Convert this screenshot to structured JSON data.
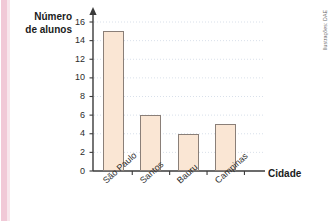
{
  "credit": "Ilustrações: DAE",
  "colors": {
    "bar_fill": "#fae6d4",
    "bar_stroke": "#8a7f78",
    "axis": "#3a3a3a",
    "grid": "#cfd8e4",
    "page_stripe": "#f1c9d7",
    "text": "#1b1b1b"
  },
  "y_axis_title_line1": "Número",
  "y_axis_title_line2": "de alunos",
  "chart_data": {
    "type": "bar",
    "title": "",
    "subtitle": "",
    "xlabel": "Cidade",
    "ylabel": "Número de alunos",
    "categories": [
      "São Paulo",
      "Santos",
      "Bauru",
      "Campinas"
    ],
    "values": [
      15,
      6,
      4,
      5
    ],
    "ylim": [
      0,
      16
    ],
    "ytick_labels": [
      "0",
      "2",
      "4",
      "6",
      "8",
      "10",
      "12",
      "14",
      "16"
    ],
    "ytick_values": [
      0,
      2,
      4,
      6,
      8,
      10,
      12,
      14,
      16
    ],
    "grid": true,
    "grid_orientation": "horizontal",
    "legend": false,
    "legend_position": "none",
    "annotations": [
      "Ilustrações: DAE"
    ]
  }
}
